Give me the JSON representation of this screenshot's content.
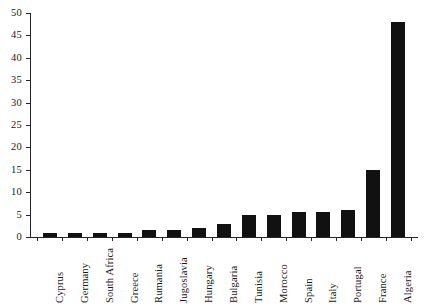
{
  "chart_data": {
    "type": "bar",
    "title": "",
    "subtitle": "",
    "xlabel": "",
    "ylabel": "",
    "ylim": [
      0,
      50
    ],
    "yticks": [
      0,
      5,
      10,
      15,
      20,
      25,
      30,
      35,
      40,
      45,
      50
    ],
    "grid": false,
    "legend": false,
    "bar_color": "#111111",
    "axis_color": "#262626",
    "categories": [
      "Cyprus",
      "Germany",
      "South Africa",
      "Greece",
      "Rumania",
      "Jugoslavia",
      "Hungary",
      "Bulgaria",
      "Tunisia",
      "Morocco",
      "Spain",
      "Italy",
      "Portugal",
      "France",
      "Algeria"
    ],
    "values": [
      1,
      1,
      1,
      1,
      1.5,
      1.5,
      2,
      3,
      5,
      5,
      5.5,
      5.5,
      6,
      15,
      48
    ]
  }
}
